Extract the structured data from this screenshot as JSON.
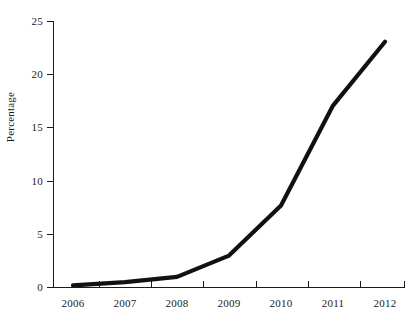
{
  "chart_data": {
    "type": "line",
    "title": "",
    "xlabel": "",
    "ylabel": "Percentage",
    "categories": [
      "2006",
      "2007",
      "2008",
      "2009",
      "2010",
      "2011",
      "2012"
    ],
    "x": [
      2006,
      2007,
      2008,
      2009,
      2010,
      2011,
      2012
    ],
    "values": [
      0.2,
      0.5,
      1.0,
      3.0,
      7.7,
      17.1,
      23.1
    ],
    "series": [
      {
        "name": "Percentage",
        "values": [
          0.2,
          0.5,
          1.0,
          3.0,
          7.7,
          17.1,
          23.1
        ],
        "color": "#111111",
        "line_width": 4.2
      }
    ],
    "ylim": [
      0,
      25
    ],
    "yticks": [
      0,
      5,
      10,
      15,
      20,
      25
    ],
    "ytick_labels": [
      "0",
      "5",
      "10",
      "15",
      "20",
      "25"
    ],
    "xtick_labels": [
      "2006",
      "2007",
      "2008",
      "2009",
      "2010",
      "2011",
      "2012"
    ],
    "grid": false,
    "legend": false,
    "legend_position": "none",
    "background_color": "#ffffff",
    "axis_color": "#1b1b1b"
  },
  "axes": {
    "y_title": "Percentage",
    "y_ticks": [
      {
        "label": "25"
      },
      {
        "label": "20"
      },
      {
        "label": "15"
      },
      {
        "label": "10"
      },
      {
        "label": "5"
      },
      {
        "label": "0"
      }
    ],
    "x_ticks": [
      {
        "label": "2006"
      },
      {
        "label": "2007"
      },
      {
        "label": "2008"
      },
      {
        "label": "2009"
      },
      {
        "label": "2010"
      },
      {
        "label": "2011"
      },
      {
        "label": "2012"
      }
    ]
  }
}
